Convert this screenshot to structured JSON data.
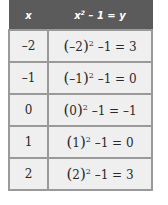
{
  "table": {
    "headers": {
      "x": "x",
      "expr_base": "x",
      "expr_exp": "2",
      "expr_rest": " – 1 = y"
    },
    "rows": [
      {
        "x": "–2",
        "base": "–2",
        "exp": "2",
        "rest": " –1 = 3"
      },
      {
        "x": "–1",
        "base": "–1",
        "exp": "2",
        "rest": " –1 = 0"
      },
      {
        "x": "0",
        "base": "0",
        "exp": "2",
        "rest": " –1 = –1"
      },
      {
        "x": "1",
        "base": "1",
        "exp": "2",
        "rest": " –1 = 0"
      },
      {
        "x": "2",
        "base": "2",
        "exp": "2",
        "rest": " –1 = 3"
      }
    ]
  },
  "colors": {
    "header_bg": "#5b5b5b",
    "cell_bg": "#efefef",
    "border": "#9a9a9a"
  }
}
